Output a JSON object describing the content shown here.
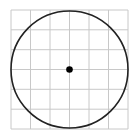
{
  "diagram": {
    "type": "circle-on-grid",
    "grid": {
      "rows": 6,
      "cols": 6,
      "line_color": "#c8c8c8"
    },
    "circle": {
      "stroke_color": "#222222",
      "center_cell": [
        3,
        3
      ],
      "radius_cells": 3
    },
    "center_point": {
      "color": "#000000"
    }
  }
}
